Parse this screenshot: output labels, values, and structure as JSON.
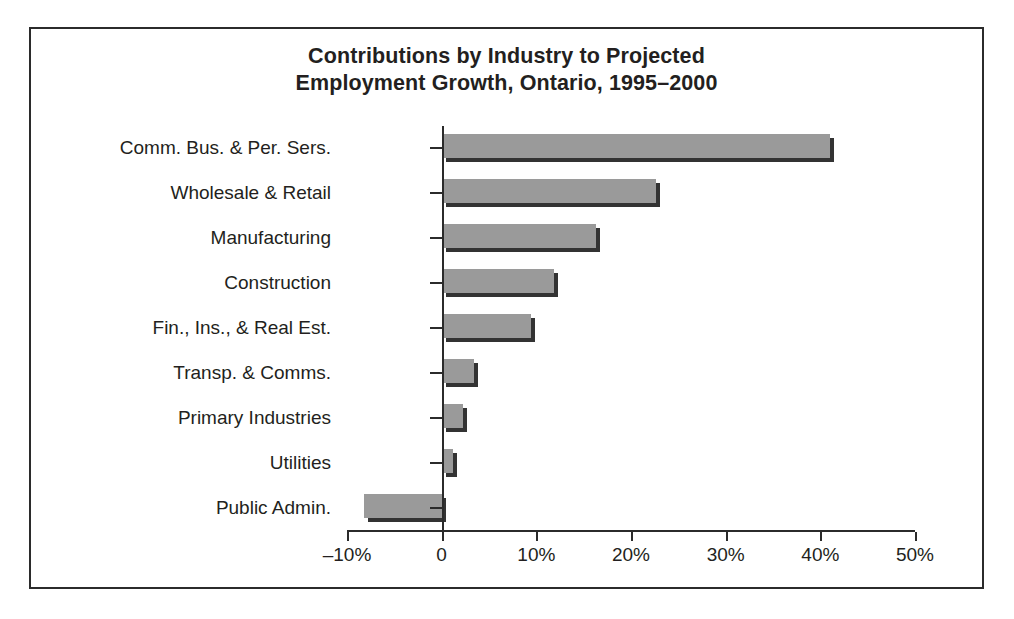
{
  "figure": {
    "caption": "Figure 10.5  Projection Bar Graph"
  },
  "chart_data": {
    "type": "bar",
    "orientation": "horizontal",
    "title": "Contributions by Industry to Projected Employment Growth, Ontario, 1995–2000",
    "title_lines": [
      "Contributions by Industry to Projected",
      "Employment Growth, Ontario, 1995–2000"
    ],
    "xlabel": "",
    "ylabel": "",
    "categories": [
      "Comm. Bus. & Per. Sers.",
      "Wholesale & Retail",
      "Manufacturing",
      "Construction",
      "Fin., Ins., & Real Est.",
      "Transp. & Comms.",
      "Primary Industries",
      "Utilities",
      "Public Admin."
    ],
    "values": [
      41.0,
      22.6,
      16.3,
      11.9,
      9.4,
      3.4,
      2.3,
      1.2,
      -8.2
    ],
    "value_unit": "%",
    "xlim": [
      -10,
      50
    ],
    "xticks": [
      -10,
      0,
      10,
      20,
      30,
      40,
      50
    ],
    "xtick_labels": [
      "–10%",
      "0",
      "10%",
      "20%",
      "30%",
      "40%",
      "50%"
    ],
    "grid": false,
    "legend": false,
    "bar_color": "#9a9a9a",
    "bar_shadow_color": "#333333",
    "axis_color": "#2b2b2b",
    "text_color": "#231f20",
    "background": "#ffffff"
  }
}
